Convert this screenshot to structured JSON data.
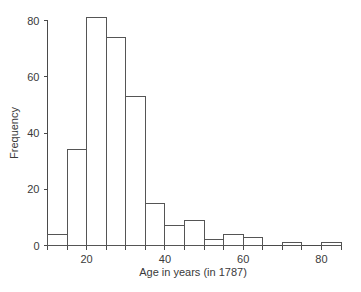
{
  "chart_data": {
    "type": "bar",
    "title": "",
    "subtitle": "",
    "xlabel": "Age in years (in 1787)",
    "ylabel": "Frequency",
    "xlim": [
      10,
      85
    ],
    "ylim": [
      0,
      83
    ],
    "bin_width": 5,
    "grid": false,
    "legend": null,
    "xticks": [
      20,
      40,
      60,
      80
    ],
    "xtick_labels": [
      "20",
      "40",
      "60",
      "80"
    ],
    "yticks": [
      0,
      20,
      40,
      60,
      80
    ],
    "ytick_labels": [
      "0",
      "20",
      "40",
      "60",
      "80"
    ],
    "bin_edges": [
      10,
      15,
      20,
      25,
      30,
      35,
      40,
      45,
      50,
      55,
      60,
      65,
      70,
      75,
      80,
      85
    ],
    "categories": [
      "10-15",
      "15-20",
      "20-25",
      "25-30",
      "30-35",
      "35-40",
      "40-45",
      "45-50",
      "50-55",
      "55-60",
      "60-65",
      "65-70",
      "70-75",
      "75-80",
      "80-85"
    ],
    "values": [
      4,
      34,
      81,
      74,
      53,
      15,
      7,
      9,
      2,
      4,
      3,
      0,
      1,
      0,
      1
    ],
    "bar_fill_color": "#ffffff",
    "bar_edge_color": "#555555",
    "axis_color": "#4a4a4a",
    "background_color": "#ffffff"
  },
  "labels": {
    "x_axis_title": "Age in years (in 1787)",
    "y_axis_title": "Frequency"
  }
}
